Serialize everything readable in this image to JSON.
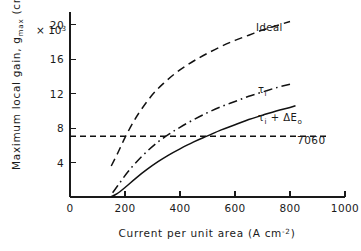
{
  "chart_data": {
    "type": "line",
    "title": "",
    "xlabel": "Current per unit area  (A cm⁻²)",
    "ylabel": "Maximum local gain, g_max  (cm⁻¹)",
    "y_multiplier": "× 10³",
    "xlim": [
      0,
      1000
    ],
    "ylim": [
      0,
      21.5
    ],
    "xticks": [
      0,
      200,
      400,
      600,
      800,
      1000
    ],
    "xtick_labels": [
      "0",
      "200",
      "400",
      "600",
      "800",
      "1000"
    ],
    "yticks": [
      4,
      8,
      12,
      16,
      20
    ],
    "ytick_labels": [
      "4",
      "8",
      "12",
      "16",
      "20"
    ],
    "grid": false,
    "legend_position": "inline-annotations",
    "annotations": [
      {
        "name": "threshold-value",
        "text": "7060",
        "x": 830,
        "y": 7.06
      },
      {
        "name": "curve-label-ideal",
        "text": "Ideal",
        "x": 660,
        "y": 16.6
      },
      {
        "name": "curve-label-tau-i",
        "text": "τᵢ",
        "x": 648,
        "y": 11.4
      },
      {
        "name": "curve-label-tau-i-de",
        "text": "τᵢ + ΔEₒ",
        "x": 650,
        "y": 8.5
      }
    ],
    "threshold": {
      "name": "7060",
      "value": 7.06,
      "label": "7060",
      "style": "dashed",
      "x_start": 0,
      "x_end": 1000
    },
    "series": [
      {
        "name": "Ideal",
        "label": "Ideal",
        "style": "dashed",
        "x": [
          150,
          175,
          200,
          230,
          260,
          300,
          340,
          380,
          420,
          460,
          500,
          550,
          600,
          650,
          700,
          750,
          800
        ],
        "values": [
          3.6,
          5.2,
          6.9,
          8.7,
          10.2,
          11.9,
          13.2,
          14.3,
          15.2,
          16.0,
          16.7,
          17.5,
          18.2,
          18.8,
          19.4,
          19.9,
          20.4
        ]
      },
      {
        "name": "τᵢ",
        "label": "τᵢ",
        "style": "dash-dot",
        "x": [
          155,
          180,
          210,
          240,
          280,
          320,
          360,
          400,
          450,
          500,
          550,
          600,
          650,
          700,
          750,
          800
        ],
        "values": [
          0.5,
          1.6,
          2.9,
          4.0,
          5.3,
          6.4,
          7.3,
          8.1,
          9.0,
          9.8,
          10.5,
          11.1,
          11.7,
          12.2,
          12.7,
          13.1
        ]
      },
      {
        "name": "τᵢ + ΔEₒ",
        "label": "τᵢ + ΔEₒ",
        "style": "solid",
        "x": [
          150,
          170,
          200,
          240,
          280,
          320,
          360,
          400,
          450,
          500,
          550,
          600,
          650,
          700,
          750,
          800,
          820
        ],
        "values": [
          0.05,
          0.35,
          1.1,
          2.2,
          3.2,
          4.1,
          4.9,
          5.6,
          6.4,
          7.1,
          7.8,
          8.4,
          9.0,
          9.5,
          10.0,
          10.4,
          10.6
        ]
      }
    ]
  },
  "axes": {
    "y_axis_name": "y-axis",
    "x_axis_name": "x-axis"
  }
}
